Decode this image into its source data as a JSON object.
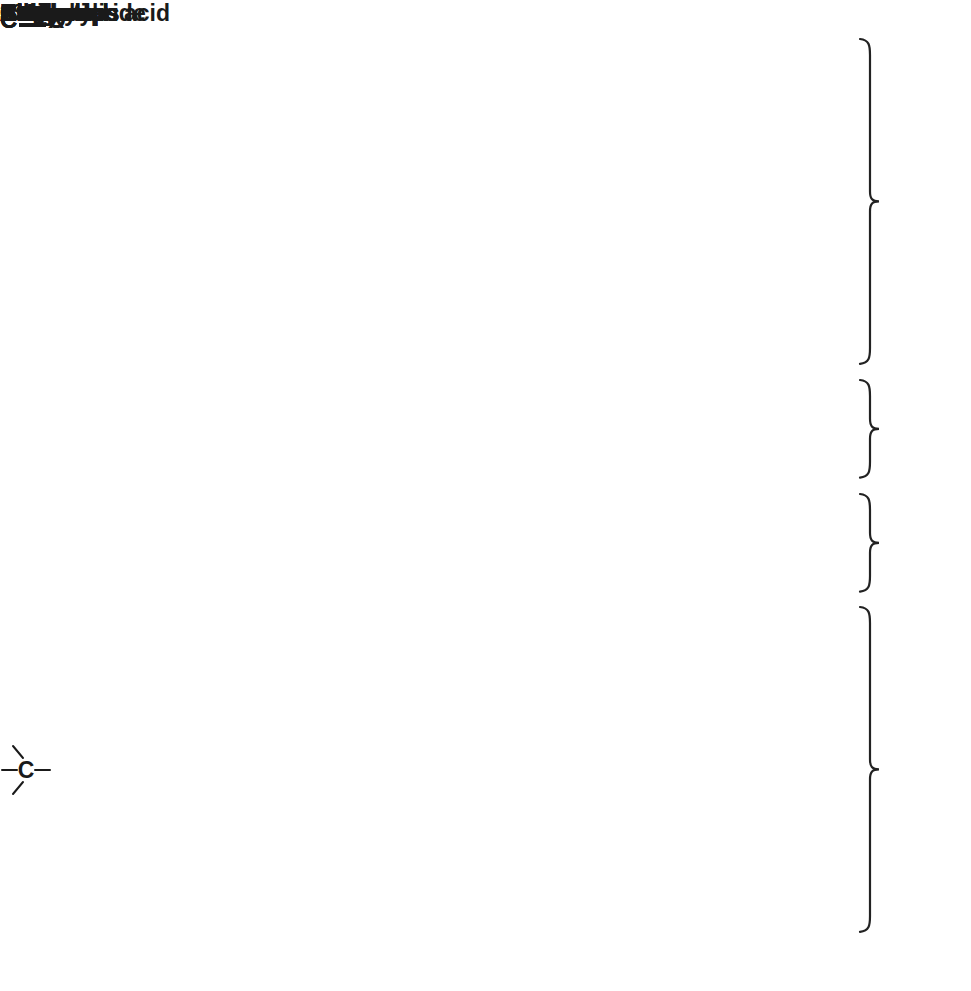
{
  "colors": {
    "page_bg": "#ffffff",
    "plot_bg": "#d8d8d8",
    "grid": "#ffffff",
    "bar_fill": "#4b4b4b",
    "bar_border": "#1a1a1a",
    "text": "#1a1a1a",
    "brace": "#222222"
  },
  "chart_data": {
    "type": "bar",
    "subtype": "horizontal-range-bars",
    "title": "",
    "xlabel": "",
    "ylabel": "",
    "x_axis": {
      "ticks": [
        220,
        200,
        180,
        160,
        140,
        120,
        100,
        80,
        60,
        40,
        20,
        0
      ],
      "min": 0,
      "max": 220,
      "reversed": true,
      "grid": true
    },
    "rows": [
      {
        "label": "Ketone",
        "range": [
          220,
          175
        ]
      },
      {
        "label": "Aldehyde",
        "range": [
          205,
          175
        ]
      },
      {
        "label": "Carboxylic acid",
        "range": [
          185,
          165
        ]
      },
      {
        "label": "Acid chloride",
        "range": [
          185,
          165
        ]
      },
      {
        "label": "Amide",
        "range": [
          180,
          160
        ]
      },
      {
        "label": "Ester",
        "range": [
          175,
          155
        ]
      },
      {
        "label": "Aromatic",
        "range": [
          155,
          110
        ]
      },
      {
        "label": "Alkene",
        "range": [
          150,
          110
        ]
      },
      {
        "label": "Nitrile",
        "range": [
          130,
          110
        ]
      },
      {
        "label": "Alkyne",
        "range": [
          100,
          70
        ]
      },
      {
        "label": "3° alcohol",
        "range": [
          85,
          70
        ]
      },
      {
        "label": "2° alcohol",
        "range": [
          75,
          60
        ]
      },
      {
        "label": "1° alcohol",
        "range": [
          70,
          40
        ]
      },
      {
        "label": "CH groups",
        "range": [
          60,
          30
        ]
      },
      {
        "label": "CH2 groups",
        "pre": "CH",
        "sub": "2",
        "post": " groups",
        "range": [
          45,
          25
        ]
      },
      {
        "label": "CH3 groups",
        "pre": "CH",
        "sub": "3",
        "post": " groups",
        "range": [
          30,
          15
        ]
      }
    ],
    "groups": [
      {
        "label": "C=O",
        "left": "C",
        "bond": "double",
        "right": "O",
        "rows": [
          0,
          5
        ]
      },
      {
        "label": "C=C",
        "left": "C",
        "bond": "double",
        "right": "C",
        "rows": [
          6,
          7
        ]
      },
      {
        "label": "C≡X",
        "left": "C",
        "bond": "triple",
        "right": "X",
        "rows": [
          8,
          9
        ]
      },
      {
        "label": "sp3 carbon",
        "symbol": "sp3-carbon",
        "rows": [
          10,
          15
        ]
      }
    ]
  }
}
